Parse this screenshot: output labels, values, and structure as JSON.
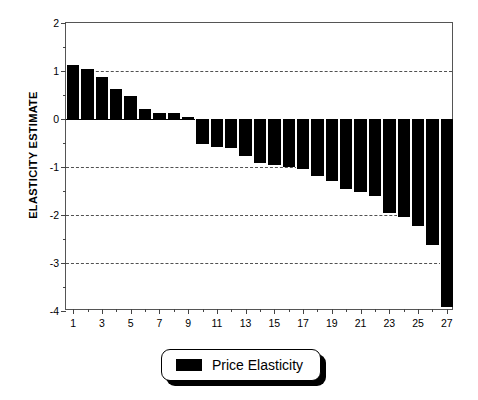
{
  "chart_data": {
    "type": "bar",
    "title": "",
    "subtitle": "",
    "xlabel": "",
    "ylabel": "ELASTICITY ESTIMATE",
    "categories": [
      1,
      2,
      3,
      4,
      5,
      6,
      7,
      8,
      9,
      10,
      11,
      12,
      13,
      14,
      15,
      16,
      17,
      18,
      19,
      20,
      21,
      22,
      23,
      24,
      25,
      26,
      27
    ],
    "values": [
      1.12,
      1.04,
      0.88,
      0.63,
      0.48,
      0.21,
      0.12,
      0.12,
      0.04,
      -0.52,
      -0.58,
      -0.6,
      -0.78,
      -0.92,
      -0.95,
      -1.0,
      -1.05,
      -1.18,
      -1.3,
      -1.45,
      -1.52,
      -1.6,
      -1.95,
      -2.05,
      -2.22,
      -2.62,
      -3.92
    ],
    "series": [
      {
        "name": "Price Elasticity",
        "values": [
          1.12,
          1.04,
          0.88,
          0.63,
          0.48,
          0.21,
          0.12,
          0.12,
          0.04,
          -0.52,
          -0.58,
          -0.6,
          -0.78,
          -0.92,
          -0.95,
          -1.0,
          -1.05,
          -1.18,
          -1.3,
          -1.45,
          -1.52,
          -1.6,
          -1.95,
          -2.05,
          -2.22,
          -2.62,
          -3.92
        ],
        "color": "#000000"
      }
    ],
    "ylim": [
      -4,
      2
    ],
    "xlim": [
      0.5,
      27.5
    ],
    "ymajor_ticks": [
      2,
      1,
      0,
      -1,
      -2,
      -3,
      -4
    ],
    "ytick_labels": [
      "2",
      "1",
      "0",
      "-1",
      "-2",
      "-3",
      "-4"
    ],
    "yminor_ticks": [
      1.5,
      0.5,
      -0.5,
      -1.5,
      -2.5,
      -3.5
    ],
    "xtick_labels": [
      "1",
      "3",
      "5",
      "7",
      "9",
      "11",
      "13",
      "15",
      "17",
      "19",
      "21",
      "23",
      "25",
      "27"
    ],
    "xtick_values": [
      1,
      3,
      5,
      7,
      9,
      11,
      13,
      15,
      17,
      19,
      21,
      23,
      25,
      27
    ],
    "xminor_ticks": [
      2,
      4,
      6,
      8,
      10,
      12,
      14,
      16,
      18,
      20,
      22,
      24,
      26
    ],
    "grid": {
      "horizontal": true,
      "style": "dashed",
      "at": [
        1,
        -1,
        -2,
        -3
      ]
    },
    "zero_line": true,
    "legend": {
      "position": "bottom-center",
      "entries": [
        {
          "label": "Price Elasticity",
          "color": "#000000"
        }
      ]
    },
    "colors": {
      "bar": "#000000",
      "axis": "#555555",
      "grid": "#333333",
      "background": "#ffffff",
      "text": "#000000"
    }
  }
}
